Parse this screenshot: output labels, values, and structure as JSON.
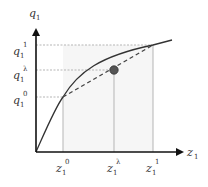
{
  "diagram": {
    "type": "concave production curve with chord interpolation",
    "axes": {
      "y_label": {
        "base": "q",
        "sub": "1"
      },
      "x_label": {
        "base": "z",
        "sub": "1"
      }
    },
    "y_ticks": [
      {
        "base": "q",
        "sub": "1",
        "sup": "1"
      },
      {
        "base": "q",
        "sub": "1",
        "sup": "λ"
      },
      {
        "base": "q",
        "sub": "1",
        "sup": "0"
      }
    ],
    "x_ticks": [
      {
        "base": "z",
        "sub": "1",
        "sup": "0"
      },
      {
        "base": "z",
        "sub": "1",
        "sup": "λ"
      },
      {
        "base": "z",
        "sub": "1",
        "sup": "1"
      }
    ],
    "elements": {
      "curve": "concave function from origin",
      "chord": "dashed line connecting (z1^0, q1^0) and (z1^1, q1^1)",
      "point": "interpolated point at (z1^λ, q1^λ)",
      "guides": "dotted reference lines to axes"
    },
    "colors": {
      "axis": "#111111",
      "curve": "#333333",
      "guide": "#b0b0b0",
      "dot": "#555555",
      "shade": "#f4f4f4"
    }
  }
}
